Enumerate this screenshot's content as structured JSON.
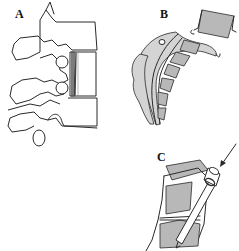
{
  "figure": {
    "panels": [
      {
        "id": "A",
        "label": "A",
        "description": "Lateral view of lumbar vertebrae with graft in intervertebral space"
      },
      {
        "id": "B",
        "label": "B",
        "description": "Curved spinal segment with shaded vertebral bodies and inserted block"
      },
      {
        "id": "C",
        "label": "C",
        "description": "Instrument inserted between vertebrae with arrow indicating direction"
      }
    ],
    "colors": {
      "line": "#2a2a2a",
      "shade": "#b8b8b8",
      "background": "#ffffff"
    }
  }
}
